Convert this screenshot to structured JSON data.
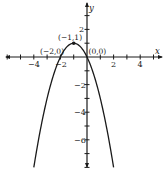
{
  "chart_data": {
    "type": "line",
    "title": "",
    "function": "y = -x^2 - 2x",
    "xlabel": "x",
    "ylabel": "y",
    "xlim": [
      -6,
      5.5
    ],
    "ylim": [
      -8,
      4
    ],
    "grid": false,
    "x_tick_labels": [
      "-4",
      "-2",
      "2",
      "4"
    ],
    "x_tick_values": [
      -4,
      -2,
      2,
      4
    ],
    "y_tick_labels": [
      "2",
      "-2",
      "-4",
      "-6"
    ],
    "y_tick_values": [
      2,
      -2,
      -4,
      -6
    ],
    "series": [
      {
        "name": "parabola",
        "x": [
          -4,
          -3.5,
          -3,
          -2.5,
          -2,
          -1.5,
          -1,
          -0.5,
          0,
          0.5,
          1,
          1.5,
          2
        ],
        "y": [
          -8,
          -5.25,
          -3,
          -1.25,
          0,
          0.75,
          1,
          0.75,
          0,
          -1.25,
          -3,
          -5.25,
          -8
        ]
      }
    ],
    "annotations": [
      {
        "label": "(−1,1)",
        "x": -1,
        "y": 1,
        "marker": "filled-dot"
      },
      {
        "label": "(−2,0)",
        "x": -2,
        "y": 0,
        "marker": "none"
      },
      {
        "label": "(0,0)",
        "x": 0,
        "y": 0,
        "marker": "none"
      }
    ]
  },
  "labels": {
    "x_axis": "x",
    "y_axis": "y",
    "xt_m4": "−4",
    "xt_m2": "−2",
    "xt_2": "2",
    "xt_4": "4",
    "yt_2": "2",
    "yt_m2": "−2",
    "yt_m4": "−4",
    "yt_m6": "−6",
    "pt_vertex": "(−1,1)",
    "pt_left_root": "(−2,0)",
    "pt_origin": "(0,0)"
  }
}
